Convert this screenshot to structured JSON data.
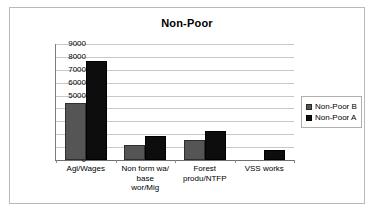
{
  "chart_data": {
    "type": "bar",
    "title": "Non-Poor",
    "xlabel": "",
    "ylabel": "",
    "ylim": [
      0,
      9000
    ],
    "ytick_step": 1000,
    "yticks": [
      0,
      1000,
      2000,
      3000,
      4000,
      5000,
      6000,
      7000,
      8000,
      9000
    ],
    "ytick_labels": [
      "0",
      "1000",
      "2000",
      "3000",
      "4000",
      "5000",
      "6000",
      "7000",
      "8000",
      "9000"
    ],
    "grid": "horizontal",
    "legend_position": "right",
    "categories": [
      "Agl/Wages",
      "Non form wa/ base wor/Mig",
      "Forest produ/NTFP",
      "VSS works"
    ],
    "category_label_lines": [
      [
        "Agl/Wages"
      ],
      [
        "Non form wa/",
        "base",
        "wor/Mig"
      ],
      [
        "Forest",
        "produ/NTFP"
      ],
      [
        "VSS works"
      ]
    ],
    "series": [
      {
        "name": "Non-Poor B",
        "color": "#555555",
        "values": [
          4450,
          1200,
          1580,
          null
        ]
      },
      {
        "name": "Non-Poor A",
        "color": "#0d0d0d",
        "values": [
          7650,
          1850,
          2220,
          750
        ]
      }
    ]
  },
  "legend": {
    "items": [
      {
        "label": "Non-Poor B"
      },
      {
        "label": "Non-Poor A"
      }
    ]
  }
}
